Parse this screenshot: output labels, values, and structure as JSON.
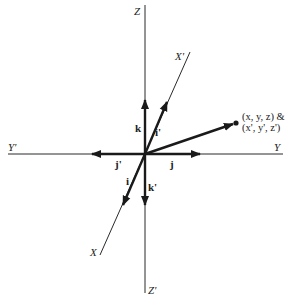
{
  "diagram": {
    "origin": [
      145,
      154
    ],
    "axes": {
      "z": {
        "label": "Z",
        "end": [
          145,
          5
        ]
      },
      "zp": {
        "label": "Z'",
        "end": [
          145,
          293
        ]
      },
      "y": {
        "label": "Y",
        "end": [
          283,
          154
        ]
      },
      "yp": {
        "label": "Y'",
        "end": [
          8,
          154
        ]
      },
      "xp": {
        "label": "X'",
        "end": [
          190,
          52
        ]
      },
      "x": {
        "label": "X",
        "end": [
          100,
          255
        ]
      }
    },
    "unit_vectors": {
      "k": {
        "label": "k",
        "tip": [
          145,
          100
        ]
      },
      "kp": {
        "label": "k'",
        "tip": [
          145,
          205
        ]
      },
      "j": {
        "label": "j",
        "tip": [
          200,
          154
        ]
      },
      "jp": {
        "label": "j'",
        "tip": [
          92,
          154
        ]
      },
      "ip": {
        "label": "i'",
        "tip": [
          167,
          102
        ]
      },
      "i": {
        "label": "i",
        "tip": [
          123,
          205
        ]
      }
    },
    "point": {
      "position": [
        236,
        123
      ],
      "label_line1": "(x, y, z) &",
      "label_line2": "(x', y', z')"
    },
    "colors": {
      "line": "#2a2a2a",
      "background": "#ffffff"
    }
  }
}
